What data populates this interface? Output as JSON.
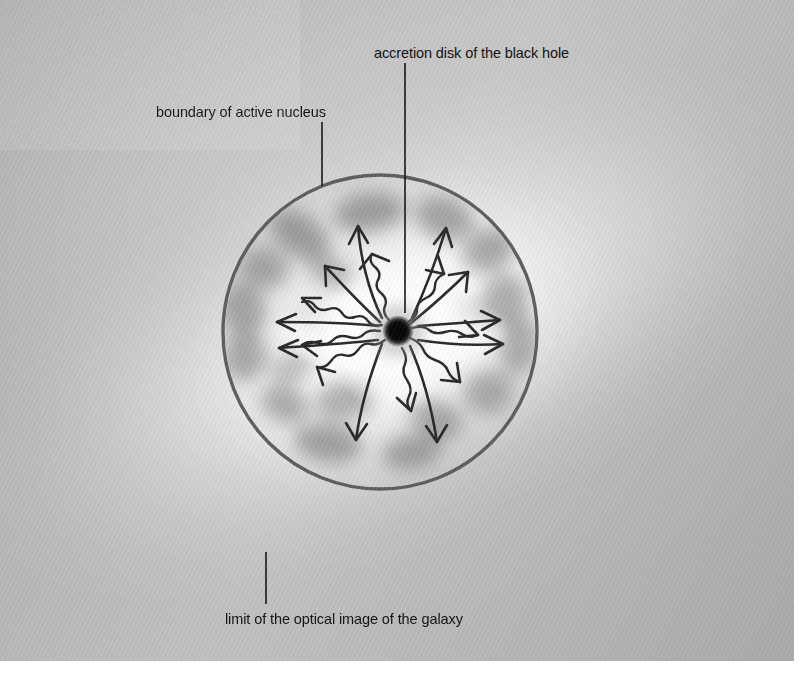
{
  "figure": {
    "kind": "astronomy-diagram",
    "medium": "halftone photographic plate scan, grayscale"
  },
  "labels": {
    "accretion_disk": "accretion disk of the black hole",
    "boundary": "boundary of active nucleus",
    "optical_limit": "limit of the optical image of the galaxy"
  },
  "icon_names": {
    "black_hole": "black-hole-icon",
    "nucleus_boundary": "nucleus-boundary-circle",
    "galaxy_halo": "galaxy-halo-glow",
    "gas_cloud": "gas-cloud-blob",
    "smooth_arrow": "smooth-outflow-arrow",
    "wavy_arrow": "wavy-radiation-arrow"
  },
  "colors": {
    "plate_background": "#b4b4b4",
    "halo_bright": "#f2f2f2",
    "circle_stroke": "#5e5e5e",
    "leader_line": "#161616",
    "arrow_stroke": "#2b2b2b",
    "gas_cloud": "#6f6f6f",
    "black_hole_core": "#080808",
    "text": "#121212",
    "page_background": "#ffffff"
  },
  "geometry": {
    "plate": {
      "x": 0,
      "y": 0,
      "width": 794,
      "height": 661
    },
    "nucleus_circle": {
      "cx": 380,
      "cy": 332,
      "r": 157,
      "stroke_width": 3.4
    },
    "black_hole": {
      "cx": 398,
      "cy": 331,
      "r": 15
    },
    "leader_lines": [
      {
        "name": "accretion-disk-leader",
        "x1": 405,
        "y1": 63,
        "x2": 405,
        "y2": 313
      },
      {
        "name": "boundary-leader",
        "x1": 322,
        "y1": 122,
        "x2": 322,
        "y2": 186
      },
      {
        "name": "optical-limit-leader",
        "x1": 266,
        "y1": 552,
        "x2": 266,
        "y2": 604
      }
    ]
  },
  "gas_clouds": [
    {
      "cx": 370,
      "cy": 212,
      "rx": 36,
      "ry": 19,
      "rot": -8,
      "opacity": 0.6
    },
    {
      "cx": 444,
      "cy": 218,
      "rx": 30,
      "ry": 21,
      "rot": 20,
      "opacity": 0.56
    },
    {
      "cx": 300,
      "cy": 235,
      "rx": 33,
      "ry": 20,
      "rot": 35,
      "opacity": 0.58
    },
    {
      "cx": 489,
      "cy": 250,
      "rx": 27,
      "ry": 21,
      "rot": -25,
      "opacity": 0.55
    },
    {
      "cx": 264,
      "cy": 268,
      "rx": 24,
      "ry": 20,
      "rot": 10,
      "opacity": 0.52
    },
    {
      "cx": 331,
      "cy": 272,
      "rx": 25,
      "ry": 15,
      "rot": 25,
      "opacity": 0.44
    },
    {
      "cx": 505,
      "cy": 300,
      "rx": 23,
      "ry": 26,
      "rot": 8,
      "opacity": 0.52
    },
    {
      "cx": 243,
      "cy": 310,
      "rx": 22,
      "ry": 28,
      "rot": -10,
      "opacity": 0.54
    },
    {
      "cx": 519,
      "cy": 345,
      "rx": 20,
      "ry": 30,
      "rot": 6,
      "opacity": 0.5
    },
    {
      "cx": 245,
      "cy": 357,
      "rx": 22,
      "ry": 24,
      "rot": 15,
      "opacity": 0.52
    },
    {
      "cx": 292,
      "cy": 368,
      "rx": 22,
      "ry": 14,
      "rot": -20,
      "opacity": 0.42
    },
    {
      "cx": 488,
      "cy": 392,
      "rx": 25,
      "ry": 22,
      "rot": -15,
      "opacity": 0.5
    },
    {
      "cx": 285,
      "cy": 404,
      "rx": 25,
      "ry": 18,
      "rot": 20,
      "opacity": 0.52
    },
    {
      "cx": 345,
      "cy": 400,
      "rx": 30,
      "ry": 20,
      "rot": -12,
      "opacity": 0.5
    },
    {
      "cx": 437,
      "cy": 420,
      "rx": 27,
      "ry": 19,
      "rot": 18,
      "opacity": 0.52
    },
    {
      "cx": 328,
      "cy": 443,
      "rx": 34,
      "ry": 19,
      "rot": 8,
      "opacity": 0.58
    },
    {
      "cx": 412,
      "cy": 452,
      "rx": 30,
      "ry": 17,
      "rot": -10,
      "opacity": 0.55
    },
    {
      "cx": 470,
      "cy": 318,
      "rx": 18,
      "ry": 14,
      "rot": 0,
      "opacity": 0.34
    },
    {
      "cx": 316,
      "cy": 318,
      "rx": 16,
      "ry": 13,
      "rot": 0,
      "opacity": 0.3
    }
  ]
}
